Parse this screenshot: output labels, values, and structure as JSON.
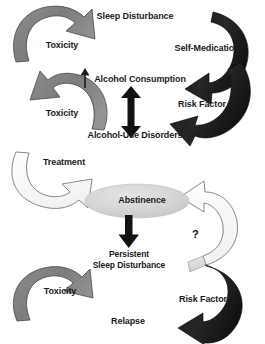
{
  "figure": {
    "background_color": "#ffffff",
    "width": 265,
    "height": 344
  },
  "palette": {
    "arrow_gray": "#808080",
    "arrow_black": "#1a1a1a",
    "arrow_white": "#fdfdfd",
    "arrow_light_gray": "#d9d9d9",
    "arrow_outline": "#4d4d4d",
    "ellipse_fill": "#d6d6d6",
    "text_color": "#1a1a1a"
  },
  "nodes": [
    {
      "id": "sleep-disturbance",
      "label": "Sleep Disturbance",
      "x": 135,
      "y": 17,
      "size": "f9"
    },
    {
      "id": "alcohol-consumption",
      "label": "Alcohol Consumption",
      "x": 138,
      "y": 80,
      "size": "f9"
    },
    {
      "id": "alcohol-use-disorders",
      "label": "Alcohol-Use Disorders",
      "x": 135,
      "y": 136,
      "size": "f9"
    },
    {
      "id": "abstinence",
      "label": "Abstinence",
      "x": 137,
      "y": 201,
      "size": "f9"
    },
    {
      "id": "persistent-sleep-disturbance",
      "label": "Persistent",
      "x": 129,
      "y": 253,
      "size": "f85"
    },
    {
      "id": "persistent-sleep-disturbance-line2",
      "label": "Sleep Disturbance",
      "x": 129,
      "y": 263,
      "size": "f85"
    },
    {
      "id": "relapse",
      "label": "Relapse",
      "x": 128,
      "y": 321,
      "size": "f9"
    }
  ],
  "edge_labels": [
    {
      "id": "toxicity-top",
      "label": "Toxicity",
      "x": 62,
      "y": 45,
      "size": "f9"
    },
    {
      "id": "toxicity-mid",
      "label": "Toxicity",
      "x": 62,
      "y": 113,
      "size": "f9"
    },
    {
      "id": "treatment",
      "label": "Treatment",
      "x": 64,
      "y": 162,
      "size": "f9"
    },
    {
      "id": "toxicity-bottom",
      "label": "Toxicity",
      "x": 60,
      "y": 291,
      "size": "f9"
    },
    {
      "id": "self-medication",
      "label": "Self-Medication",
      "x": 207,
      "y": 49,
      "size": "f9"
    },
    {
      "id": "risk-factor-top",
      "label": "Risk Factor",
      "x": 202,
      "y": 105,
      "size": "f9"
    },
    {
      "id": "risk-factor-bottom",
      "label": "Risk Factor",
      "x": 203,
      "y": 299,
      "size": "f9"
    },
    {
      "id": "unknown-link",
      "label": "?",
      "x": 195,
      "y": 235,
      "size": "f9"
    }
  ],
  "connectors": [
    {
      "id": "up-arrow-consumption",
      "kind": "thin-up-arrow",
      "meaning": "increase"
    },
    {
      "id": "bidirectional-arrow",
      "kind": "double-headed-vertical",
      "meaning": "bidirectional association between alcohol consumption and alcohol-use disorders"
    },
    {
      "id": "abstinence-to-persistent",
      "kind": "down-arrow",
      "meaning": "abstinence leads to persistent sleep disturbance"
    }
  ],
  "arrows": [
    {
      "id": "toxicity-arrow-top",
      "color": "#808080",
      "direction": "clockwise-up-right",
      "label": "Toxicity"
    },
    {
      "id": "toxicity-arrow-mid",
      "color": "#808080",
      "direction": "counter-clockwise-up-left",
      "label": "Toxicity"
    },
    {
      "id": "treatment-arrow",
      "color": "#fdfdfd",
      "direction": "clockwise-down-right",
      "label": "Treatment"
    },
    {
      "id": "toxicity-arrow-bottom",
      "color": "#808080",
      "direction": "clockwise-up-right",
      "label": "Toxicity"
    },
    {
      "id": "self-medication-arrow",
      "color": "#1a1a1a",
      "direction": "counter-clockwise-down-left",
      "label": "Self-Medication"
    },
    {
      "id": "risk-factor-arrow-top",
      "color": "#1a1a1a",
      "direction": "clockwise-down-left",
      "label": "Risk Factor"
    },
    {
      "id": "question-arrow",
      "color": "#fdfdfd",
      "direction": "counter-clockwise-up-left",
      "label": "?"
    },
    {
      "id": "risk-factor-arrow-bottom",
      "color": "#1a1a1a",
      "direction": "clockwise-down-left",
      "label": "Risk Factor"
    }
  ]
}
